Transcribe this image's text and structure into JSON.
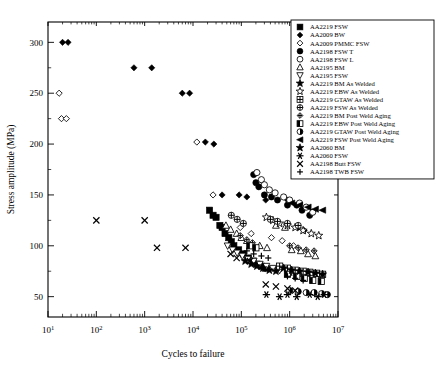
{
  "chart_data": {
    "type": "scatter",
    "title": "",
    "xlabel": "Cycles to failure",
    "ylabel": "Stress amplitude (MPa)",
    "xscale": "log",
    "yscale": "linear",
    "xlim": [
      10,
      10000000
    ],
    "ylim": [
      30,
      320
    ],
    "grid": false,
    "legend_position": "top-right",
    "xtick_labels": [
      "10¹",
      "10²",
      "10³",
      "10⁴",
      "10⁵",
      "10⁶",
      "10⁷"
    ],
    "xtick_mantissas": [
      "10",
      "10",
      "10",
      "10",
      "10",
      "10",
      "10"
    ],
    "xtick_exponents": [
      "1",
      "2",
      "3",
      "4",
      "5",
      "6",
      "7"
    ],
    "xtick_values": [
      10,
      100,
      1000,
      10000,
      100000,
      1000000,
      10000000
    ],
    "ytick_labels": [
      "50",
      "100",
      "150",
      "200",
      "250",
      "300"
    ],
    "ytick_values": [
      50,
      100,
      150,
      200,
      250,
      300
    ],
    "series": [
      {
        "name": "AA2219 FSW",
        "marker": "filled-square",
        "points": [
          [
            22000,
            135
          ],
          [
            26000,
            130
          ],
          [
            30000,
            128
          ],
          [
            36000,
            120
          ],
          [
            40000,
            118
          ],
          [
            46000,
            112
          ],
          [
            55000,
            108
          ],
          [
            62000,
            104
          ],
          [
            70000,
            100
          ],
          [
            88000,
            96
          ],
          [
            110000,
            92
          ],
          [
            140000,
            88
          ],
          [
            175000,
            85
          ],
          [
            210000,
            82
          ],
          [
            260000,
            80
          ],
          [
            320000,
            78
          ]
        ]
      },
      {
        "name": "AA2009 BW",
        "marker": "filled-diamond",
        "points": [
          [
            20,
            300
          ],
          [
            26,
            300
          ],
          [
            600,
            275
          ],
          [
            1400,
            275
          ],
          [
            6000,
            250
          ],
          [
            8500,
            250
          ],
          [
            18000,
            202
          ],
          [
            27000,
            200
          ],
          [
            40000,
            150
          ],
          [
            90000,
            150
          ],
          [
            130000,
            148
          ],
          [
            320000,
            145
          ],
          [
            900000,
            145
          ],
          [
            1500000,
            118
          ],
          [
            2000000,
            115
          ]
        ]
      },
      {
        "name": "AA2009 PMMC FSW",
        "marker": "open-diamond",
        "points": [
          [
            17,
            250
          ],
          [
            19,
            225
          ],
          [
            24,
            225
          ],
          [
            12000,
            202
          ],
          [
            26000,
            150
          ],
          [
            95000,
            118
          ],
          [
            160000,
            112
          ],
          [
            420000,
            108
          ],
          [
            700000,
            105
          ],
          [
            1200000,
            100
          ]
        ]
      },
      {
        "name": "AA2198 FSW T",
        "marker": "filled-circle",
        "points": [
          [
            180000,
            170
          ],
          [
            200000,
            162
          ],
          [
            230000,
            158
          ],
          [
            300000,
            150
          ],
          [
            420000,
            148
          ],
          [
            560000,
            145
          ],
          [
            900000,
            140
          ],
          [
            1400000,
            140
          ],
          [
            1800000,
            135
          ],
          [
            2600000,
            130
          ]
        ]
      },
      {
        "name": "AA2198 FSW L",
        "marker": "open-circle",
        "points": [
          [
            210000,
            172
          ],
          [
            260000,
            165
          ],
          [
            300000,
            160
          ],
          [
            380000,
            155
          ],
          [
            500000,
            152
          ],
          [
            750000,
            148
          ],
          [
            1000000,
            145
          ],
          [
            1600000,
            142
          ],
          [
            2200000,
            138
          ],
          [
            3000000,
            133
          ]
        ]
      },
      {
        "name": "AA2195 BM",
        "marker": "open-triangle-up",
        "points": [
          [
            48000,
            120
          ],
          [
            60000,
            116
          ],
          [
            80000,
            112
          ],
          [
            100000,
            108
          ],
          [
            130000,
            105
          ],
          [
            170000,
            102
          ],
          [
            240000,
            100
          ],
          [
            340000,
            98
          ],
          [
            520000,
            120
          ],
          [
            800000,
            118
          ],
          [
            1100000,
            96
          ],
          [
            1700000,
            95
          ],
          [
            2400000,
            92
          ],
          [
            3400000,
            90
          ]
        ]
      },
      {
        "name": "AA2195 FSW",
        "marker": "open-triangle-down",
        "points": [
          [
            52000,
            100
          ],
          [
            66000,
            96
          ],
          [
            82000,
            93
          ],
          [
            105000,
            90
          ],
          [
            135000,
            87
          ],
          [
            180000,
            85
          ],
          [
            240000,
            82
          ],
          [
            330000,
            80
          ],
          [
            450000,
            78
          ],
          [
            620000,
            76
          ],
          [
            900000,
            75
          ],
          [
            1400000,
            74
          ]
        ]
      },
      {
        "name": "AA2219 BM As Welded",
        "marker": "filled-star",
        "points": [
          [
            120000,
            85
          ],
          [
            160000,
            82
          ],
          [
            210000,
            80
          ],
          [
            280000,
            78
          ],
          [
            380000,
            76
          ],
          [
            520000,
            75
          ],
          [
            1000000,
            74
          ],
          [
            1500000,
            73
          ],
          [
            2400000,
            72
          ],
          [
            3600000,
            72
          ]
        ]
      },
      {
        "name": "AA2219 EBW As Welded",
        "marker": "open-star",
        "points": [
          [
            330000,
            128
          ],
          [
            450000,
            125
          ],
          [
            620000,
            122
          ],
          [
            900000,
            120
          ],
          [
            1300000,
            118
          ],
          [
            1900000,
            115
          ],
          [
            2800000,
            112
          ],
          [
            4000000,
            110
          ]
        ]
      },
      {
        "name": "AA2219 GTAW As Welded",
        "marker": "grid-square",
        "points": [
          [
            620000,
            80
          ],
          [
            900000,
            78
          ],
          [
            1300000,
            76
          ],
          [
            1900000,
            75
          ],
          [
            2600000,
            74
          ],
          [
            3600000,
            73
          ],
          [
            4800000,
            72
          ]
        ]
      },
      {
        "name": "AA2219 FSW As Welded",
        "marker": "circle-cross",
        "points": [
          [
            62000,
            130
          ],
          [
            82000,
            126
          ],
          [
            110000,
            122
          ],
          [
            400000,
            126
          ],
          [
            560000,
            124
          ],
          [
            900000,
            122
          ],
          [
            1500000,
            120
          ]
        ]
      },
      {
        "name": "AA2219 BM Post Weld Aging",
        "marker": "diamond-cross",
        "points": [
          [
            95000,
            110
          ],
          [
            130000,
            106
          ],
          [
            170000,
            103
          ],
          [
            1000000,
            100
          ],
          [
            1500000,
            98
          ],
          [
            2200000,
            96
          ],
          [
            3200000,
            95
          ]
        ]
      },
      {
        "name": "AA2219 EBW Post Weld Aging",
        "marker": "half-square",
        "points": [
          [
            150000,
            100
          ],
          [
            200000,
            98
          ],
          [
            900000,
            72
          ],
          [
            1400000,
            70
          ],
          [
            2000000,
            68
          ],
          [
            3000000,
            66
          ],
          [
            4500000,
            65
          ]
        ]
      },
      {
        "name": "AA2219 GTAW Post Weld Aging",
        "marker": "half-circle",
        "points": [
          [
            1000000,
            56
          ],
          [
            1500000,
            55
          ],
          [
            2200000,
            54
          ],
          [
            3200000,
            54
          ],
          [
            4600000,
            53
          ],
          [
            6000000,
            52
          ]
        ]
      },
      {
        "name": "AA2219 FSW Post Weld Aging",
        "marker": "left-triangle",
        "points": [
          [
            1100000,
            142
          ],
          [
            1600000,
            140
          ],
          [
            2400000,
            138
          ],
          [
            3400000,
            136
          ],
          [
            4800000,
            135
          ]
        ]
      },
      {
        "name": "AA2060 BM",
        "marker": "bold-star",
        "points": [
          [
            750000,
            78
          ],
          [
            1100000,
            76
          ],
          [
            1600000,
            75
          ],
          [
            2400000,
            74
          ],
          [
            3400000,
            73
          ],
          [
            4800000,
            72
          ]
        ]
      },
      {
        "name": "AA2060 FSW",
        "marker": "asterisk",
        "points": [
          [
            330000,
            52
          ],
          [
            620000,
            50
          ],
          [
            900000,
            52
          ],
          [
            1400000,
            50
          ],
          [
            2600000,
            52
          ],
          [
            3800000,
            50
          ],
          [
            5200000,
            52
          ]
        ]
      },
      {
        "name": "AA2198 Butt FSW",
        "marker": "x-mark",
        "points": [
          [
            100,
            125
          ],
          [
            1000,
            125
          ],
          [
            1800,
            98
          ],
          [
            7000,
            98
          ],
          [
            60000,
            92
          ],
          [
            80000,
            88
          ],
          [
            150000,
            85
          ],
          [
            320000,
            62
          ],
          [
            520000,
            60
          ],
          [
            900000,
            58
          ],
          [
            1300000,
            56
          ]
        ]
      },
      {
        "name": "AA2198 TWB FSW",
        "marker": "plus",
        "points": [
          [
            130000,
            95
          ],
          [
            180000,
            92
          ],
          [
            260000,
            90
          ],
          [
            360000,
            88
          ],
          [
            900000,
            70
          ],
          [
            1300000,
            68
          ],
          [
            1900000,
            66
          ]
        ]
      }
    ]
  },
  "legend": {
    "items": [
      {
        "label": "AA2219 FSW",
        "marker": "filled-square"
      },
      {
        "label": "AA2009 BW",
        "marker": "filled-diamond"
      },
      {
        "label": "AA2009 PMMC FSW",
        "marker": "open-diamond"
      },
      {
        "label": "AA2198 FSW T",
        "marker": "filled-circle"
      },
      {
        "label": "AA2198 FSW L",
        "marker": "open-circle"
      },
      {
        "label": "AA2195 BM",
        "marker": "open-triangle-up"
      },
      {
        "label": "AA2195 FSW",
        "marker": "open-triangle-down"
      },
      {
        "label": "AA2219 BM As Welded",
        "marker": "filled-star"
      },
      {
        "label": "AA2219 EBW As Welded",
        "marker": "open-star"
      },
      {
        "label": "AA2219 GTAW As Welded",
        "marker": "grid-square"
      },
      {
        "label": "AA2219 FSW As Welded",
        "marker": "circle-cross"
      },
      {
        "label": "AA2219 BM Post Weld Aging",
        "marker": "diamond-cross"
      },
      {
        "label": "AA2219 EBW Post Weld Aging",
        "marker": "half-square"
      },
      {
        "label": "AA2219 GTAW Post Weld Aging",
        "marker": "half-circle"
      },
      {
        "label": "AA2219 FSW Post Weld Aging",
        "marker": "left-triangle"
      },
      {
        "label": "AA2060 BM",
        "marker": "bold-star"
      },
      {
        "label": "AA2060 FSW",
        "marker": "asterisk"
      },
      {
        "label": "AA2198 Butt FSW",
        "marker": "x-mark"
      },
      {
        "label": "AA2198 TWB FSW",
        "marker": "plus"
      }
    ]
  }
}
